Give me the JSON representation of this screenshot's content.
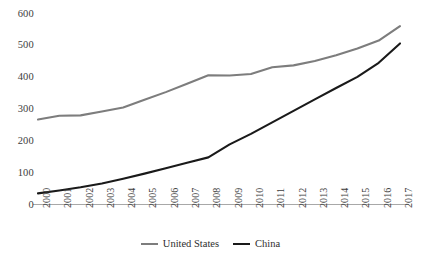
{
  "chart_data": {
    "type": "line",
    "title": "",
    "subtitle": "",
    "xlabel": "",
    "ylabel": "",
    "xlim": [
      2000,
      2017
    ],
    "ylim": [
      0,
      600
    ],
    "yticks": [
      0,
      100,
      200,
      300,
      400,
      500,
      600
    ],
    "grid": false,
    "legend_position": "bottom-center",
    "x": [
      2000,
      2001,
      2002,
      2003,
      2004,
      2005,
      2006,
      2007,
      2008,
      2009,
      2010,
      2011,
      2012,
      2013,
      2014,
      2015,
      2016,
      2017
    ],
    "categories": [
      "2000",
      "2001",
      "2002",
      "2003",
      "2004",
      "2005",
      "2006",
      "2007",
      "2008",
      "2009",
      "2010",
      "2011",
      "2012",
      "2013",
      "2014",
      "2015",
      "2016",
      "2017"
    ],
    "series": [
      {
        "name": "United States",
        "color": "#7d7d7d",
        "values": [
          267,
          279,
          280,
          292,
          305,
          329,
          353,
          379,
          406,
          405,
          410,
          431,
          437,
          451,
          469,
          490,
          515,
          560
        ]
      },
      {
        "name": "China",
        "color": "#1a1a1a",
        "values": [
          35,
          44,
          54,
          66,
          81,
          97,
          114,
          131,
          148,
          189,
          222,
          258,
          294,
          330,
          366,
          401,
          445,
          506
        ]
      }
    ]
  },
  "legend": {
    "items": [
      {
        "label": "United States",
        "color": "#7d7d7d"
      },
      {
        "label": "China",
        "color": "#1a1a1a"
      }
    ]
  },
  "axes": {
    "x_axis_color": "#a8a8a8",
    "y_tick_labels": [
      "600",
      "500",
      "400",
      "300",
      "200",
      "100",
      "0"
    ],
    "x_tick_labels": [
      "2000",
      "2001",
      "2002",
      "2003",
      "2004",
      "2005",
      "2006",
      "2007",
      "2008",
      "2009",
      "2010",
      "2011",
      "2012",
      "2013",
      "2014",
      "2015",
      "2016",
      "2017"
    ]
  }
}
